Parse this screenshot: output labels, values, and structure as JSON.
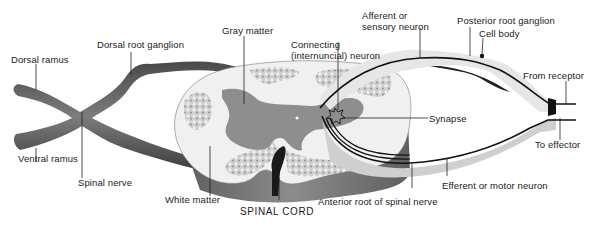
{
  "figure": {
    "title": "SPINAL CORD",
    "colors": {
      "nerve": "#6e6e6e",
      "nerve_dark": "#3a3a3a",
      "white_matter": "#f2f2f2",
      "gray_matter": "#8a8a8a",
      "stipple": "#bdbdbd",
      "cord_side": "#7a7a7a",
      "neuron_line": "#111111",
      "sensory_sheath": "#e4e4e4"
    }
  },
  "labels": {
    "dorsal_ramus": "Dorsal ramus",
    "dorsal_root_ganglion": "Dorsal root ganglion",
    "gray_matter": "Gray matter",
    "connecting_neuron_1": "Connecting",
    "connecting_neuron_2": "(internuncial) neuron",
    "afferent_1": "Afferent or",
    "afferent_2": "sensory neuron",
    "posterior_root_ganglion": "Posterior root ganglion",
    "cell_body": "Cell body",
    "from_receptor": "From receptor",
    "synapse": "Synapse",
    "to_effector": "To effector",
    "ventral_ramus": "Ventral ramus",
    "spinal_nerve": "Spinal nerve",
    "white_matter": "White matter",
    "spinal_cord": "SPINAL CORD",
    "anterior_root": "Anterior root of spinal nerve",
    "efferent": "Efferent or motor neuron"
  }
}
